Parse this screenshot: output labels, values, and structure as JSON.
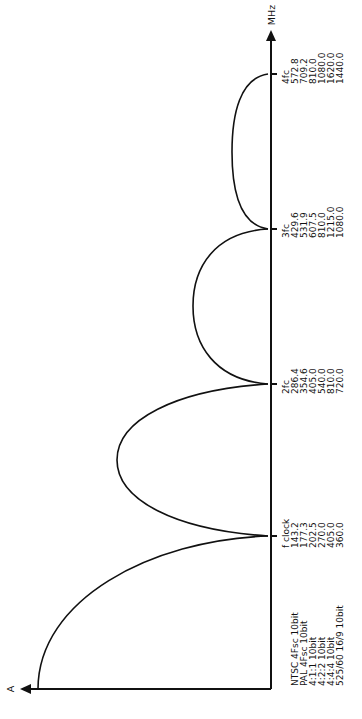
{
  "diagram": {
    "orientation": "rotated-90-ccw",
    "y_axis_label": "A",
    "x_axis_label": "MHz",
    "row_labels": [
      "NTSC 4Fsc 10bit",
      "PAL 4Fsc 10bit",
      "4:1:1 10bit",
      "4:2:2 10bit",
      "4:4:4 10bit",
      "525/60 16/9 10bit"
    ],
    "columns": [
      {
        "label": "f clock",
        "values": [
          "143.2",
          "177.3",
          "202.5",
          "270.0",
          "405.0",
          "360.0"
        ]
      },
      {
        "label": "2fc",
        "values": [
          "286.4",
          "354.6",
          "405.0",
          "540.0",
          "810.0",
          "720.0"
        ]
      },
      {
        "label": "3fc",
        "values": [
          "429.6",
          "531.9",
          "607.5",
          "810.0",
          "1215.0",
          "1080.0"
        ]
      },
      {
        "label": "4fc",
        "values": [
          "572.8",
          "709.2",
          "810.0",
          "1080.0",
          "1620.0",
          "1440.0"
        ]
      }
    ],
    "colors": {
      "line": "#111111",
      "background": "#ffffff"
    }
  }
}
